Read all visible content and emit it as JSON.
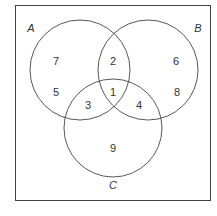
{
  "diagram": {
    "type": "venn",
    "sets": [
      {
        "name": "A",
        "cx": 80,
        "cy": 70,
        "r": 50
      },
      {
        "name": "B",
        "cx": 148,
        "cy": 70,
        "r": 50
      },
      {
        "name": "C",
        "cx": 113,
        "cy": 128,
        "r": 49
      }
    ],
    "regions": [
      {
        "label": "7",
        "x": 56,
        "y": 61
      },
      {
        "label": "5",
        "x": 56,
        "y": 92
      },
      {
        "label": "2",
        "x": 113,
        "y": 61
      },
      {
        "label": "6",
        "x": 176,
        "y": 61
      },
      {
        "label": "8",
        "x": 177,
        "y": 92
      },
      {
        "label": "1",
        "x": 113,
        "y": 92
      },
      {
        "label": "3",
        "x": 88,
        "y": 105
      },
      {
        "label": "4",
        "x": 139,
        "y": 105
      },
      {
        "label": "9",
        "x": 113,
        "y": 148
      }
    ],
    "set_labels": [
      {
        "label": "A",
        "x": 31,
        "y": 28
      },
      {
        "label": "B",
        "x": 198,
        "y": 28
      },
      {
        "label": "C",
        "x": 113,
        "y": 185
      }
    ]
  }
}
